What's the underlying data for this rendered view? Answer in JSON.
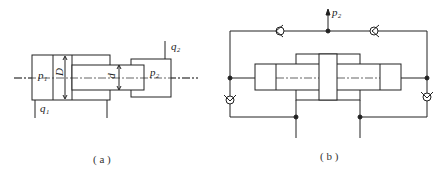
{
  "figure_a": {
    "caption": "( a )",
    "labels": {
      "p1": "p₁",
      "D": "D",
      "d": "d",
      "p2": "p₂",
      "q1": "q₁",
      "q2": "q₂"
    }
  },
  "figure_b": {
    "caption": "( b )",
    "labels": {
      "p2": "p₂"
    }
  },
  "colors": {
    "line": "#222222",
    "background": "#ffffff"
  }
}
